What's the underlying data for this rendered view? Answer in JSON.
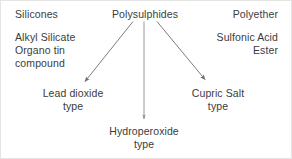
{
  "diagram": {
    "style": {
      "text_color": "#3b3b3b",
      "line_color": "#6e6e6e",
      "background": "#ffffff",
      "border_color": "#e4e4e4"
    },
    "columns": {
      "left": {
        "heading": "Silicones",
        "items": [
          "Alkyl Silicate",
          "Organo tin",
          "compound"
        ]
      },
      "center": {
        "heading": "Polysulphides"
      },
      "right": {
        "heading": "Polyether",
        "items": [
          "Sulfonic Acid",
          "Ester"
        ]
      }
    },
    "branches": [
      {
        "id": "lead-dioxide",
        "label_line1": "Lead dioxide",
        "label_line2": "type",
        "arrow": "diagonal-left"
      },
      {
        "id": "hydroperoxide",
        "label_line1": "Hydroperoxide",
        "label_line2": "type",
        "arrow": "vertical"
      },
      {
        "id": "cupric-salt",
        "label_line1": "Cupric Salt",
        "label_line2": "type",
        "arrow": "diagonal-right"
      }
    ]
  }
}
